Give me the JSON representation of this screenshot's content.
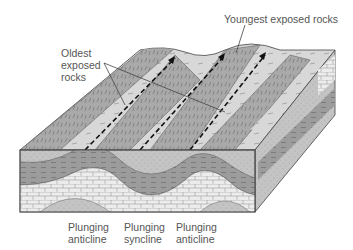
{
  "diagram": {
    "type": "block diagram",
    "colors": {
      "sandstone": "#c8c8c8",
      "shale": "#9a9a9a",
      "limestone": "#e6e6e6",
      "light_layer": "#dcdcdc",
      "outline": "#444444",
      "label_text": "#555555"
    }
  },
  "labels": {
    "oldest": {
      "line1": "Oldest",
      "line2": "exposed",
      "line3": "rocks"
    },
    "youngest": "Youngest exposed rocks",
    "bottom": [
      {
        "line1": "Plunging",
        "line2": "anticline"
      },
      {
        "line1": "Plunging",
        "line2": "syncline"
      },
      {
        "line1": "Plunging",
        "line2": "anticline"
      }
    ]
  }
}
